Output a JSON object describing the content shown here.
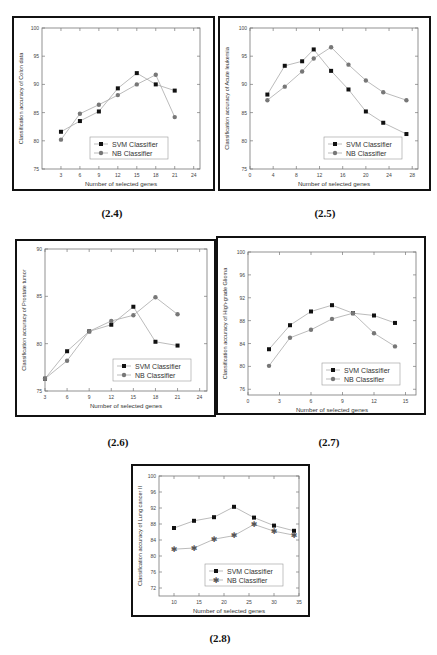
{
  "figures": [
    {
      "id": "2.4",
      "caption": "(2.4)"
    },
    {
      "id": "2.5",
      "caption": "(2.5)"
    },
    {
      "id": "2.6",
      "caption": "(2.6)"
    },
    {
      "id": "2.7",
      "caption": "(2.7)"
    },
    {
      "id": "2.8",
      "caption": "(2.8)"
    }
  ],
  "chart_data": [
    {
      "id": "2.4",
      "type": "line",
      "title": "",
      "xlabel": "Number of selected genes",
      "ylabel": "Classification accuracy of Colon data",
      "xlim": [
        0,
        25
      ],
      "ylim": [
        75,
        100
      ],
      "xticks": [
        3,
        6,
        9,
        12,
        15,
        18,
        21,
        24
      ],
      "yticks": [
        75,
        80,
        85,
        90,
        95,
        100
      ],
      "grid": false,
      "legend_position": "lower center",
      "series": [
        {
          "name": "SVM Classifier",
          "marker": "square",
          "color": "#111111",
          "x": [
            3,
            6,
            9,
            12,
            15,
            18,
            21
          ],
          "values": [
            81.6,
            83.5,
            85.2,
            89.3,
            92.0,
            90.0,
            88.9
          ]
        },
        {
          "name": "NB Classifier",
          "marker": "circle",
          "color": "#777777",
          "x": [
            3,
            6,
            9,
            12,
            15,
            18,
            21
          ],
          "values": [
            80.2,
            84.8,
            86.4,
            88.1,
            90.0,
            91.7,
            84.2
          ]
        }
      ]
    },
    {
      "id": "2.5",
      "type": "line",
      "title": "",
      "xlabel": "Number of selected genes",
      "ylabel": "Classification accuracy of Acute leukemia",
      "xlim": [
        0,
        29
      ],
      "ylim": [
        75,
        100
      ],
      "xticks": [
        0,
        4,
        8,
        12,
        16,
        20,
        24,
        28
      ],
      "yticks": [
        75,
        80,
        85,
        90,
        95,
        100
      ],
      "grid": false,
      "legend_position": "lower right",
      "series": [
        {
          "name": "SVM Classifier",
          "marker": "square",
          "color": "#111111",
          "x": [
            3,
            6,
            9,
            11,
            14,
            17,
            20,
            23,
            27
          ],
          "values": [
            88.2,
            93.3,
            94.1,
            96.2,
            92.4,
            89.1,
            85.2,
            83.2,
            81.2
          ]
        },
        {
          "name": "NB Classifier",
          "marker": "circle",
          "color": "#777777",
          "x": [
            3,
            6,
            9,
            11,
            14,
            17,
            20,
            23,
            27
          ],
          "values": [
            87.2,
            89.6,
            92.3,
            94.6,
            96.6,
            93.5,
            90.7,
            88.6,
            87.2
          ]
        }
      ]
    },
    {
      "id": "2.6",
      "type": "line",
      "title": "",
      "xlabel": "Number of selected genes",
      "ylabel": "Classification accuracy of Prostate tumor",
      "xlim": [
        3,
        25
      ],
      "ylim": [
        75,
        90
      ],
      "xticks": [
        3,
        6,
        9,
        12,
        15,
        18,
        21,
        24
      ],
      "yticks": [
        75,
        80,
        85,
        90
      ],
      "grid": false,
      "legend_position": "lower right",
      "series": [
        {
          "name": "SVM Classifier",
          "marker": "square",
          "color": "#111111",
          "x": [
            3,
            6,
            9,
            12,
            15,
            18,
            21
          ],
          "values": [
            76.3,
            79.2,
            81.3,
            82.0,
            83.9,
            80.2,
            79.8
          ]
        },
        {
          "name": "NB Classifier",
          "marker": "circle",
          "color": "#777777",
          "x": [
            3,
            6,
            9,
            12,
            15,
            18,
            21
          ],
          "values": [
            76.3,
            78.2,
            81.3,
            82.4,
            83.0,
            84.9,
            83.1
          ]
        }
      ]
    },
    {
      "id": "2.7",
      "type": "line",
      "title": "",
      "xlabel": "Number of selected genes",
      "ylabel": "Classification accuracy of High-grade Glioma",
      "xlim": [
        0,
        16
      ],
      "ylim": [
        75,
        100
      ],
      "xticks": [
        0,
        3,
        6,
        9,
        12,
        15
      ],
      "yticks": [
        76,
        80,
        84,
        88,
        92,
        96,
        100
      ],
      "grid": false,
      "legend_position": "lower right",
      "series": [
        {
          "name": "SVM Classifier",
          "marker": "square",
          "color": "#111111",
          "x": [
            2,
            4,
            6,
            8,
            10,
            12,
            14
          ],
          "values": [
            83.0,
            87.2,
            89.6,
            90.7,
            89.3,
            88.9,
            87.6
          ]
        },
        {
          "name": "NB Classifier",
          "marker": "circle",
          "color": "#777777",
          "x": [
            2,
            4,
            6,
            8,
            10,
            12,
            14
          ],
          "values": [
            80.1,
            85.0,
            86.4,
            88.3,
            89.3,
            85.8,
            83.5
          ]
        }
      ]
    },
    {
      "id": "2.8",
      "type": "line",
      "title": "",
      "xlabel": "Number of selected genes",
      "ylabel": "Classification accuracy of Lung cancer II",
      "xlim": [
        7,
        35
      ],
      "ylim": [
        70,
        100
      ],
      "xticks": [
        10,
        15,
        20,
        25,
        30,
        35
      ],
      "yticks": [
        72,
        76,
        80,
        84,
        88,
        92,
        96,
        100
      ],
      "grid": false,
      "legend_position": "lower right",
      "series": [
        {
          "name": "SVM Classifier",
          "marker": "square",
          "color": "#111111",
          "x": [
            10,
            14,
            18,
            22,
            26,
            30,
            34
          ],
          "values": [
            87.0,
            88.8,
            89.7,
            92.3,
            89.6,
            87.6,
            86.3
          ]
        },
        {
          "name": "NB Classifier",
          "marker": "star",
          "color": "#555555",
          "x": [
            10,
            14,
            18,
            22,
            26,
            30,
            34
          ],
          "values": [
            81.7,
            82.0,
            84.2,
            85.1,
            87.9,
            86.2,
            85.2
          ]
        }
      ]
    }
  ]
}
